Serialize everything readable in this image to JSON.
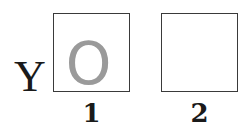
{
  "row_label": "Y",
  "cells": [
    {
      "column": "1",
      "content": "O",
      "content_color": "#9a9a9a"
    },
    {
      "column": "2",
      "content": ""
    }
  ],
  "column_labels": [
    "1",
    "2"
  ]
}
